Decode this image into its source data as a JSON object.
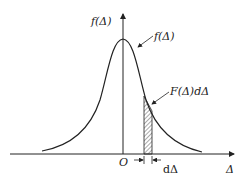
{
  "diagram": {
    "type": "normal-distribution-curve",
    "y_axis_label": "f(Δ)",
    "curve_label": "f(Δ)",
    "strip_label": "F(Δ)dΔ",
    "origin_label": "O",
    "x_axis_label": "Δ",
    "width_label": "dΔ",
    "colors": {
      "line": "#222222",
      "hatch": "#555555",
      "background": "#ffffff"
    }
  }
}
